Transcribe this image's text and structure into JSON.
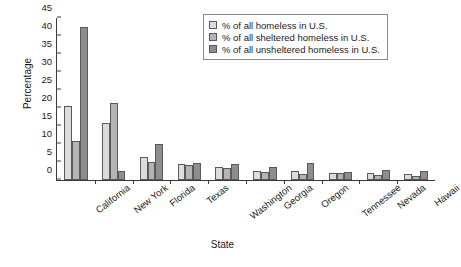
{
  "chart_data": {
    "type": "bar",
    "title": "",
    "xlabel": "State",
    "ylabel": "Percentage",
    "ylim": [
      0,
      45
    ],
    "yticks": [
      0,
      5,
      10,
      15,
      20,
      25,
      30,
      35,
      40,
      45
    ],
    "grid": false,
    "legend_position": "top-right",
    "categories": [
      "California",
      "New York",
      "Florida",
      "Texas",
      "Washington",
      "Georgia",
      "Oregon",
      "Tennessee",
      "Nevada",
      "Hawaii"
    ],
    "series": [
      {
        "name": "% of all homeless in U.S.",
        "color": "#dcdcdc",
        "values": [
          20.5,
          15.7,
          6.5,
          4.4,
          3.7,
          2.6,
          2.6,
          2.0,
          1.9,
          1.6
        ]
      },
      {
        "name": "% of all sheltered homeless in U.S.",
        "color": "#b4b4b4",
        "values": [
          10.8,
          21.5,
          5.0,
          4.3,
          3.4,
          2.3,
          1.8,
          1.9,
          1.4,
          1.2
        ]
      },
      {
        "name": "% of all unsheltered homeless in U.S.",
        "color": "#8e8e8e",
        "values": [
          42.5,
          2.4,
          10.0,
          4.6,
          4.4,
          3.6,
          4.6,
          2.2,
          2.8,
          2.5
        ]
      }
    ]
  }
}
